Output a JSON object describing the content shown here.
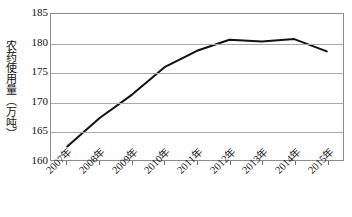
{
  "chart_data": {
    "type": "line",
    "title": "",
    "xlabel": "",
    "ylabel": "农药使用量（万吨）",
    "categories": [
      "2007年",
      "2008年",
      "2009年",
      "2010年",
      "2011年",
      "2012年",
      "2013年",
      "2014年",
      "2015年"
    ],
    "values": [
      162.3,
      167.2,
      171.2,
      175.9,
      178.7,
      180.6,
      180.3,
      180.7,
      178.6
    ],
    "series": [
      {
        "name": "农药使用量",
        "values": [
          162.3,
          167.2,
          171.2,
          175.9,
          178.7,
          180.6,
          180.3,
          180.7,
          178.6
        ]
      }
    ],
    "ylim": [
      160,
      185
    ],
    "yticks": [
      160,
      165,
      170,
      175,
      180,
      185
    ],
    "ytick_labels": [
      "160",
      "165",
      "170",
      "175",
      "180",
      "185"
    ],
    "xlim_categories": 9,
    "grid": "horizontal",
    "legend": "none",
    "line_color": "#111111",
    "grid_color": "#a9a9a9",
    "axis_color": "#8c8c8c",
    "background_color": "#ffffff",
    "markers": "none",
    "line_width": 2
  },
  "axis": {
    "y_title": "农药使用量（万吨）"
  }
}
